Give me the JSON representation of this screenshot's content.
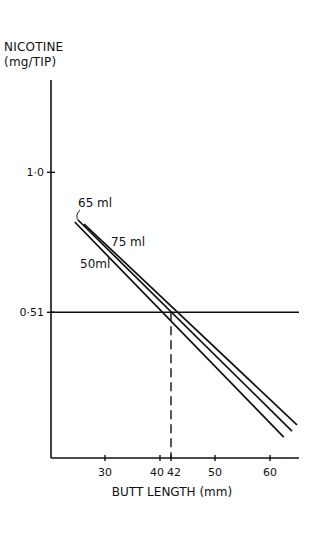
{
  "chart_data": {
    "type": "line",
    "title": "",
    "ylabel": "NICOTINE (mg/TIP)",
    "ylabel_lines": [
      "NICOTINE",
      "(mg/TIP)"
    ],
    "xlabel": "BUTT LENGTH (mm)",
    "xlim": [
      20.5,
      65.5
    ],
    "ylim": [
      0,
      1.5
    ],
    "xticks": [
      30,
      40,
      42,
      50,
      60
    ],
    "xtick_labels": [
      "30",
      "40",
      "42",
      "50",
      "60"
    ],
    "yticks": [
      0.51,
      1.0
    ],
    "ytick_labels": [
      "0·51",
      "1·0"
    ],
    "grid": false,
    "legend": "inline labels",
    "series": [
      {
        "name": "65 ml",
        "label": "65ml",
        "x": [
          25.1,
          64.0
        ],
        "y": [
          0.833,
          0.094
        ]
      },
      {
        "name": "75 ml",
        "label": "75ml",
        "x": [
          26.2,
          64.9
        ],
        "y": [
          0.819,
          0.116
        ]
      },
      {
        "name": "50 ml",
        "label": "50ml",
        "x": [
          24.5,
          62.5
        ],
        "y": [
          0.826,
          0.073
        ]
      }
    ],
    "annotations": [
      {
        "type": "hline",
        "y": 0.51,
        "style": "solid"
      },
      {
        "type": "vline",
        "x": 42,
        "from_y": 0,
        "to_y": 0.51,
        "style": "dashed"
      }
    ]
  }
}
